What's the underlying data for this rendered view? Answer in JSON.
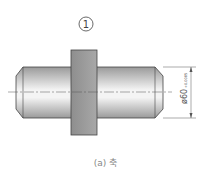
{
  "diagram": {
    "part_number": "1",
    "dimension": {
      "symbol": "ø60",
      "tolerance": "+0.0085"
    },
    "caption": "(a) 축",
    "colors": {
      "shaft_light": "#f2f2f2",
      "shaft_dark": "#9a9a9a",
      "collar": "#9a9a9a",
      "outline": "#444444"
    }
  }
}
